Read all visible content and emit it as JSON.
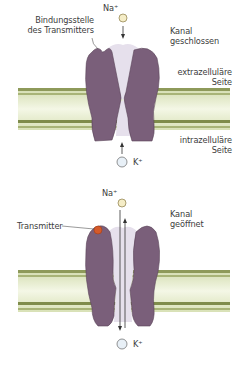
{
  "diagram": {
    "type": "ligand-gated ion channel",
    "colors": {
      "protein": "#7a5f7a",
      "protein_edge": "#5b4459",
      "pore": "#e6e0ec",
      "membrane_band": "#dfe7c3",
      "membrane_edge": "#7c8a4c",
      "membrane_core": "#f3f6e4",
      "na_ion": "#f5edc7",
      "k_ion": "#e8f0f7",
      "transmitter": "#d45a2a"
    },
    "panels": [
      {
        "state": "closed",
        "state_label_line1": "Kanal",
        "state_label_line2": "geschlossen",
        "na_label": "Na⁺",
        "k_label": "K⁺",
        "binding_site_line1": "Bindungsstelle",
        "binding_site_line2": "des Transmitters",
        "extracellular_line1": "extrazelluläre",
        "extracellular_line2": "Seite",
        "intracellular_line1": "intrazelluläre",
        "intracellular_line2": "Seite"
      },
      {
        "state": "open",
        "state_label_line1": "Kanal",
        "state_label_line2": "geöffnet",
        "na_label": "Na⁺",
        "k_label": "K⁺",
        "transmitter_label": "Transmitter"
      }
    ]
  }
}
